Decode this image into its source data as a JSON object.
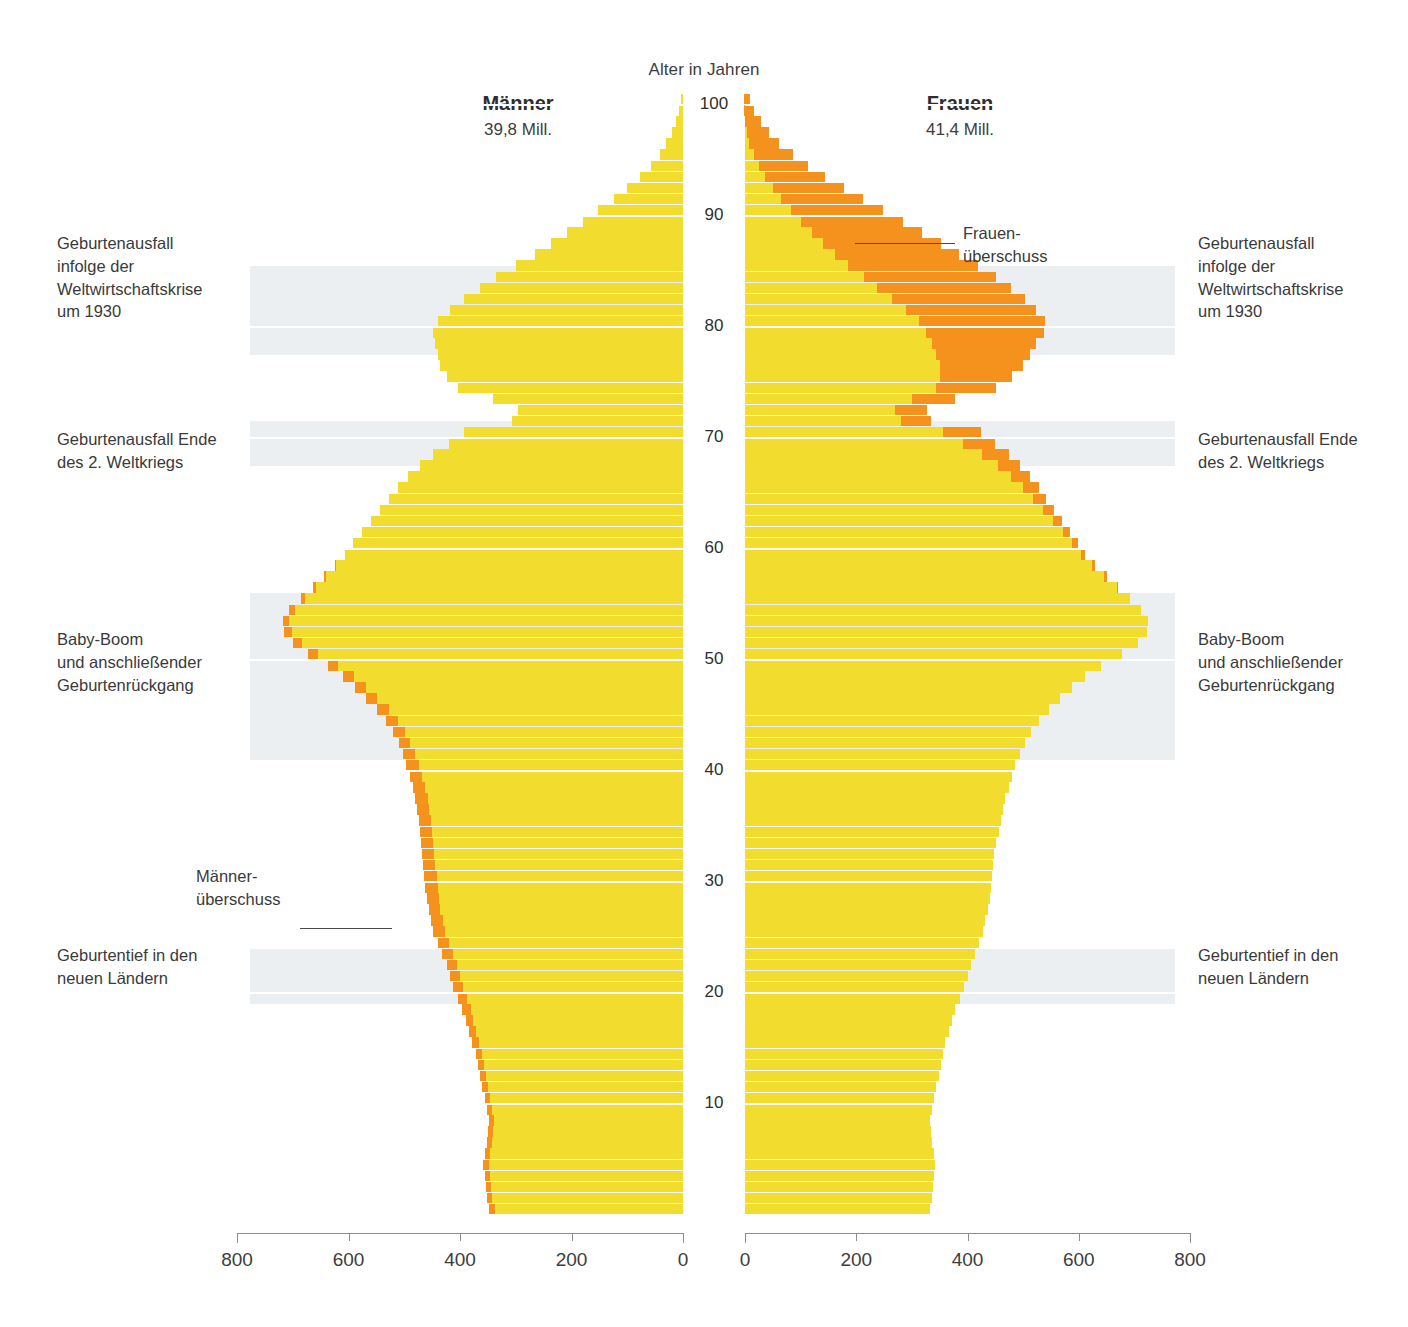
{
  "chart_data": {
    "type": "bar",
    "subtype": "population-pyramid",
    "title": "",
    "axis_title_center": "Alter in Jahren",
    "xlabel": "",
    "ylabel": "Alter in Jahren",
    "xlim": [
      0,
      800
    ],
    "ylim": [
      0,
      100
    ],
    "x_ticks_left": [
      "800",
      "600",
      "400",
      "200",
      "0"
    ],
    "x_ticks_right": [
      "0",
      "200",
      "400",
      "600",
      "800"
    ],
    "y_ticks": [
      "10",
      "20",
      "30",
      "40",
      "50",
      "60",
      "70",
      "80",
      "90",
      "100"
    ],
    "grid": false,
    "legend_position": "none",
    "colors": {
      "base": "#f2dd2e",
      "surplus": "#f5921e",
      "band": "#eceff1",
      "axis": "#8a8f96"
    },
    "series": [
      {
        "name": "Männer",
        "side": "left",
        "total_label": "39,8 Mill."
      },
      {
        "name": "Frauen",
        "side": "right",
        "total_label": "41,4 Mill."
      }
    ],
    "unit_note": "Tausend Personen je Altersjahr",
    "ages": [
      0,
      1,
      2,
      3,
      4,
      5,
      6,
      7,
      8,
      9,
      10,
      11,
      12,
      13,
      14,
      15,
      16,
      17,
      18,
      19,
      20,
      21,
      22,
      23,
      24,
      25,
      26,
      27,
      28,
      29,
      30,
      31,
      32,
      33,
      34,
      35,
      36,
      37,
      38,
      39,
      40,
      41,
      42,
      43,
      44,
      45,
      46,
      47,
      48,
      49,
      50,
      51,
      52,
      53,
      54,
      55,
      56,
      57,
      58,
      59,
      60,
      61,
      62,
      63,
      64,
      65,
      66,
      67,
      68,
      69,
      70,
      71,
      72,
      73,
      74,
      75,
      76,
      77,
      78,
      79,
      80,
      81,
      82,
      83,
      84,
      85,
      86,
      87,
      88,
      89,
      90,
      91,
      92,
      93,
      94,
      95,
      96,
      97,
      98,
      99,
      100
    ],
    "male": [
      348,
      352,
      354,
      356,
      358,
      356,
      352,
      350,
      348,
      352,
      356,
      360,
      364,
      368,
      372,
      378,
      384,
      390,
      396,
      404,
      412,
      418,
      424,
      432,
      440,
      448,
      452,
      456,
      460,
      462,
      464,
      466,
      468,
      470,
      472,
      474,
      478,
      480,
      484,
      490,
      496,
      502,
      510,
      520,
      532,
      548,
      568,
      588,
      610,
      636,
      672,
      700,
      716,
      718,
      706,
      686,
      664,
      644,
      624,
      606,
      592,
      576,
      560,
      544,
      528,
      512,
      494,
      472,
      448,
      420,
      392,
      306,
      296,
      340,
      404,
      424,
      436,
      440,
      444,
      448,
      440,
      418,
      392,
      364,
      336,
      300,
      266,
      236,
      208,
      180,
      152,
      124,
      100,
      78,
      58,
      42,
      30,
      20,
      12,
      7,
      4
    ],
    "male_surplus": [
      10,
      10,
      10,
      10,
      10,
      10,
      10,
      9,
      9,
      9,
      10,
      10,
      10,
      11,
      11,
      12,
      13,
      14,
      15,
      16,
      17,
      18,
      18,
      19,
      20,
      21,
      21,
      21,
      22,
      22,
      22,
      22,
      22,
      22,
      22,
      22,
      22,
      22,
      22,
      22,
      22,
      21,
      21,
      21,
      21,
      20,
      20,
      19,
      19,
      18,
      17,
      16,
      14,
      12,
      10,
      8,
      6,
      4,
      2,
      0,
      0,
      0,
      0,
      0,
      0,
      0,
      0,
      0,
      0,
      0,
      0,
      0,
      0,
      0,
      0,
      0,
      0,
      0,
      0,
      0,
      0,
      0,
      0,
      0,
      0,
      0,
      0,
      0,
      0,
      0,
      0,
      0,
      0,
      0,
      0,
      0,
      0,
      0,
      0,
      0,
      0
    ],
    "female": [
      332,
      336,
      338,
      340,
      342,
      340,
      336,
      334,
      332,
      336,
      340,
      344,
      348,
      352,
      356,
      360,
      366,
      372,
      378,
      386,
      394,
      400,
      406,
      414,
      420,
      428,
      432,
      436,
      440,
      442,
      444,
      446,
      448,
      452,
      456,
      460,
      464,
      468,
      474,
      480,
      486,
      494,
      504,
      514,
      528,
      546,
      566,
      588,
      612,
      640,
      678,
      706,
      722,
      724,
      712,
      692,
      670,
      650,
      630,
      612,
      598,
      584,
      570,
      556,
      542,
      528,
      512,
      494,
      474,
      450,
      424,
      334,
      328,
      378,
      452,
      480,
      500,
      512,
      524,
      538,
      540,
      524,
      504,
      478,
      452,
      418,
      384,
      352,
      318,
      284,
      248,
      212,
      178,
      144,
      114,
      86,
      62,
      44,
      28,
      16,
      9
    ],
    "female_surplus": [
      0,
      0,
      0,
      0,
      0,
      0,
      0,
      0,
      0,
      0,
      0,
      0,
      0,
      0,
      0,
      0,
      0,
      0,
      0,
      0,
      0,
      0,
      0,
      0,
      0,
      0,
      0,
      0,
      0,
      0,
      0,
      0,
      0,
      0,
      0,
      0,
      0,
      0,
      0,
      0,
      0,
      0,
      0,
      0,
      0,
      0,
      0,
      0,
      0,
      0,
      0,
      0,
      0,
      0,
      0,
      0,
      2,
      4,
      6,
      8,
      10,
      13,
      16,
      20,
      24,
      28,
      34,
      40,
      48,
      58,
      68,
      54,
      58,
      78,
      108,
      130,
      150,
      168,
      188,
      212,
      228,
      234,
      240,
      240,
      238,
      232,
      222,
      212,
      198,
      184,
      166,
      148,
      128,
      108,
      88,
      70,
      54,
      40,
      28,
      17,
      10
    ]
  },
  "headers": {
    "male": {
      "title": "Männer",
      "subtitle": "39,8 Mill."
    },
    "female": {
      "title": "Frauen",
      "subtitle": "41,4 Mill."
    },
    "center_axis": "Alter in Jahren"
  },
  "annotations_left": [
    {
      "id": "depression",
      "lines": [
        "Geburtenausfall",
        "infolge der",
        "Weltwirtschaftskrise",
        "um 1930"
      ]
    },
    {
      "id": "ww2",
      "lines": [
        "Geburtenausfall Ende",
        "des  2. Weltkriegs"
      ]
    },
    {
      "id": "babyboom",
      "lines": [
        "Baby-Boom",
        "und anschließender",
        "Geburtenrückgang"
      ]
    },
    {
      "id": "maennerueberschuss",
      "lines": [
        "Männer-",
        "überschuss"
      ]
    },
    {
      "id": "geburtentief",
      "lines": [
        "Geburtentief in den",
        "neuen Ländern"
      ]
    }
  ],
  "annotations_right": [
    {
      "id": "frauenueberschuss",
      "lines": [
        "Frauen-",
        "überschuss"
      ]
    },
    {
      "id": "depression",
      "lines": [
        "Geburtenausfall",
        "infolge der",
        "Weltwirtschaftskrise",
        "um 1930"
      ]
    },
    {
      "id": "ww2",
      "lines": [
        "Geburtenausfall Ende",
        "des  2. Weltkriegs"
      ]
    },
    {
      "id": "babyboom",
      "lines": [
        "Baby-Boom",
        "und anschließender",
        "Geburtenrückgang"
      ]
    },
    {
      "id": "geburtentief",
      "lines": [
        "Geburtentief in den",
        "neuen Ländern"
      ]
    }
  ]
}
